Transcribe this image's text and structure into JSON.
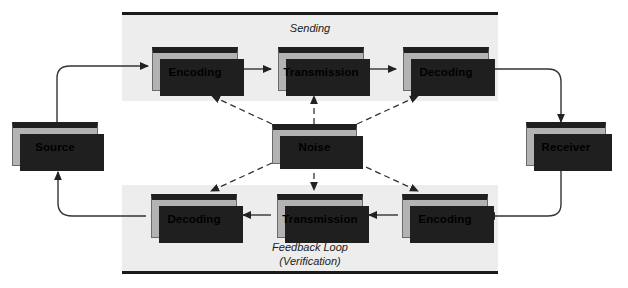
{
  "diagram": {
    "colors": {
      "panel_background": "#ededed",
      "box_fill": "#b3b3b3",
      "box_border_top": "#1f1f1f",
      "shadow": "#1f1f1f",
      "line": "#333333",
      "page_background": "#ffffff"
    },
    "sending_panel": {
      "label": "Sending",
      "boxes": [
        {
          "label": "Encoding"
        },
        {
          "label": "Transmission"
        },
        {
          "label": "Decoding"
        }
      ]
    },
    "feedback_panel": {
      "label_line1": "Feedback Loop",
      "label_line2": "(Verification)",
      "boxes": [
        {
          "label": "Decoding"
        },
        {
          "label": "Transmission"
        },
        {
          "label": "Encoding"
        }
      ]
    },
    "endpoints": {
      "source": "Source",
      "receiver": "Receiver"
    },
    "interference": {
      "label": "Noise"
    }
  }
}
